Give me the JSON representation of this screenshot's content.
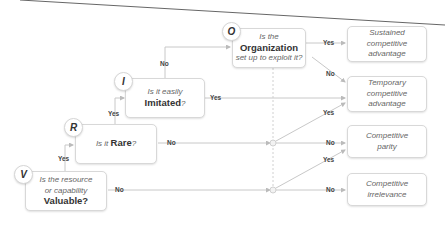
{
  "nodes": {
    "v": {
      "letter": "V",
      "line1": "Is the resource",
      "line2": "or capability",
      "bold": "Valuable?"
    },
    "r": {
      "letter": "R",
      "prefix": "Is it ",
      "bold": "Rare",
      "suffix": "?"
    },
    "i": {
      "letter": "I",
      "line1": "Is it easily",
      "bold": "Imitated",
      "suffix": "?"
    },
    "o": {
      "letter": "O",
      "line1": "Is the",
      "bold": "Organization",
      "line3": "set up to exploit it?"
    }
  },
  "outcomes": {
    "sustained": {
      "line1": "Sustained",
      "line2": "competitive",
      "line3": "advantage"
    },
    "temporary": {
      "line1": "Temporary",
      "line2": "competitive",
      "line3": "advantage"
    },
    "parity": {
      "line1": "Competitive",
      "line2": "parity"
    },
    "irrelevance": {
      "line1": "Competitive",
      "line2": "irrelevance"
    }
  },
  "edge_labels": {
    "v_yes": "Yes",
    "v_no": "No",
    "r_yes": "Yes",
    "r_no": "No",
    "i_no": "No",
    "i_yes": "Yes",
    "o_yes": "Yes",
    "o_no": "No",
    "mid_yes": "Yes",
    "mid_no": "No",
    "low_yes": "Yes",
    "low_no": "No"
  },
  "colors": {
    "line": "#c8c8c8",
    "box_border": "#d8d8d8",
    "text": "#666666",
    "bold_text": "#333333"
  }
}
